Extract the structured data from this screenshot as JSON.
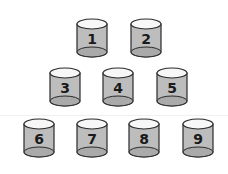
{
  "colors": {
    "background": "#ffffff",
    "body": "#bdbdbd",
    "top": "#f7f7f7",
    "bottom": "#aaaaaa",
    "outline": "#2a2a2a",
    "label": "#1a1a1a"
  },
  "rows": [
    {
      "cylinders": [
        {
          "label": "1"
        },
        {
          "label": "2"
        }
      ]
    },
    {
      "cylinders": [
        {
          "label": "3"
        },
        {
          "label": "4"
        },
        {
          "label": "5"
        }
      ]
    },
    {
      "cylinders": [
        {
          "label": "6"
        },
        {
          "label": "7"
        },
        {
          "label": "8"
        },
        {
          "label": "9"
        }
      ]
    }
  ]
}
